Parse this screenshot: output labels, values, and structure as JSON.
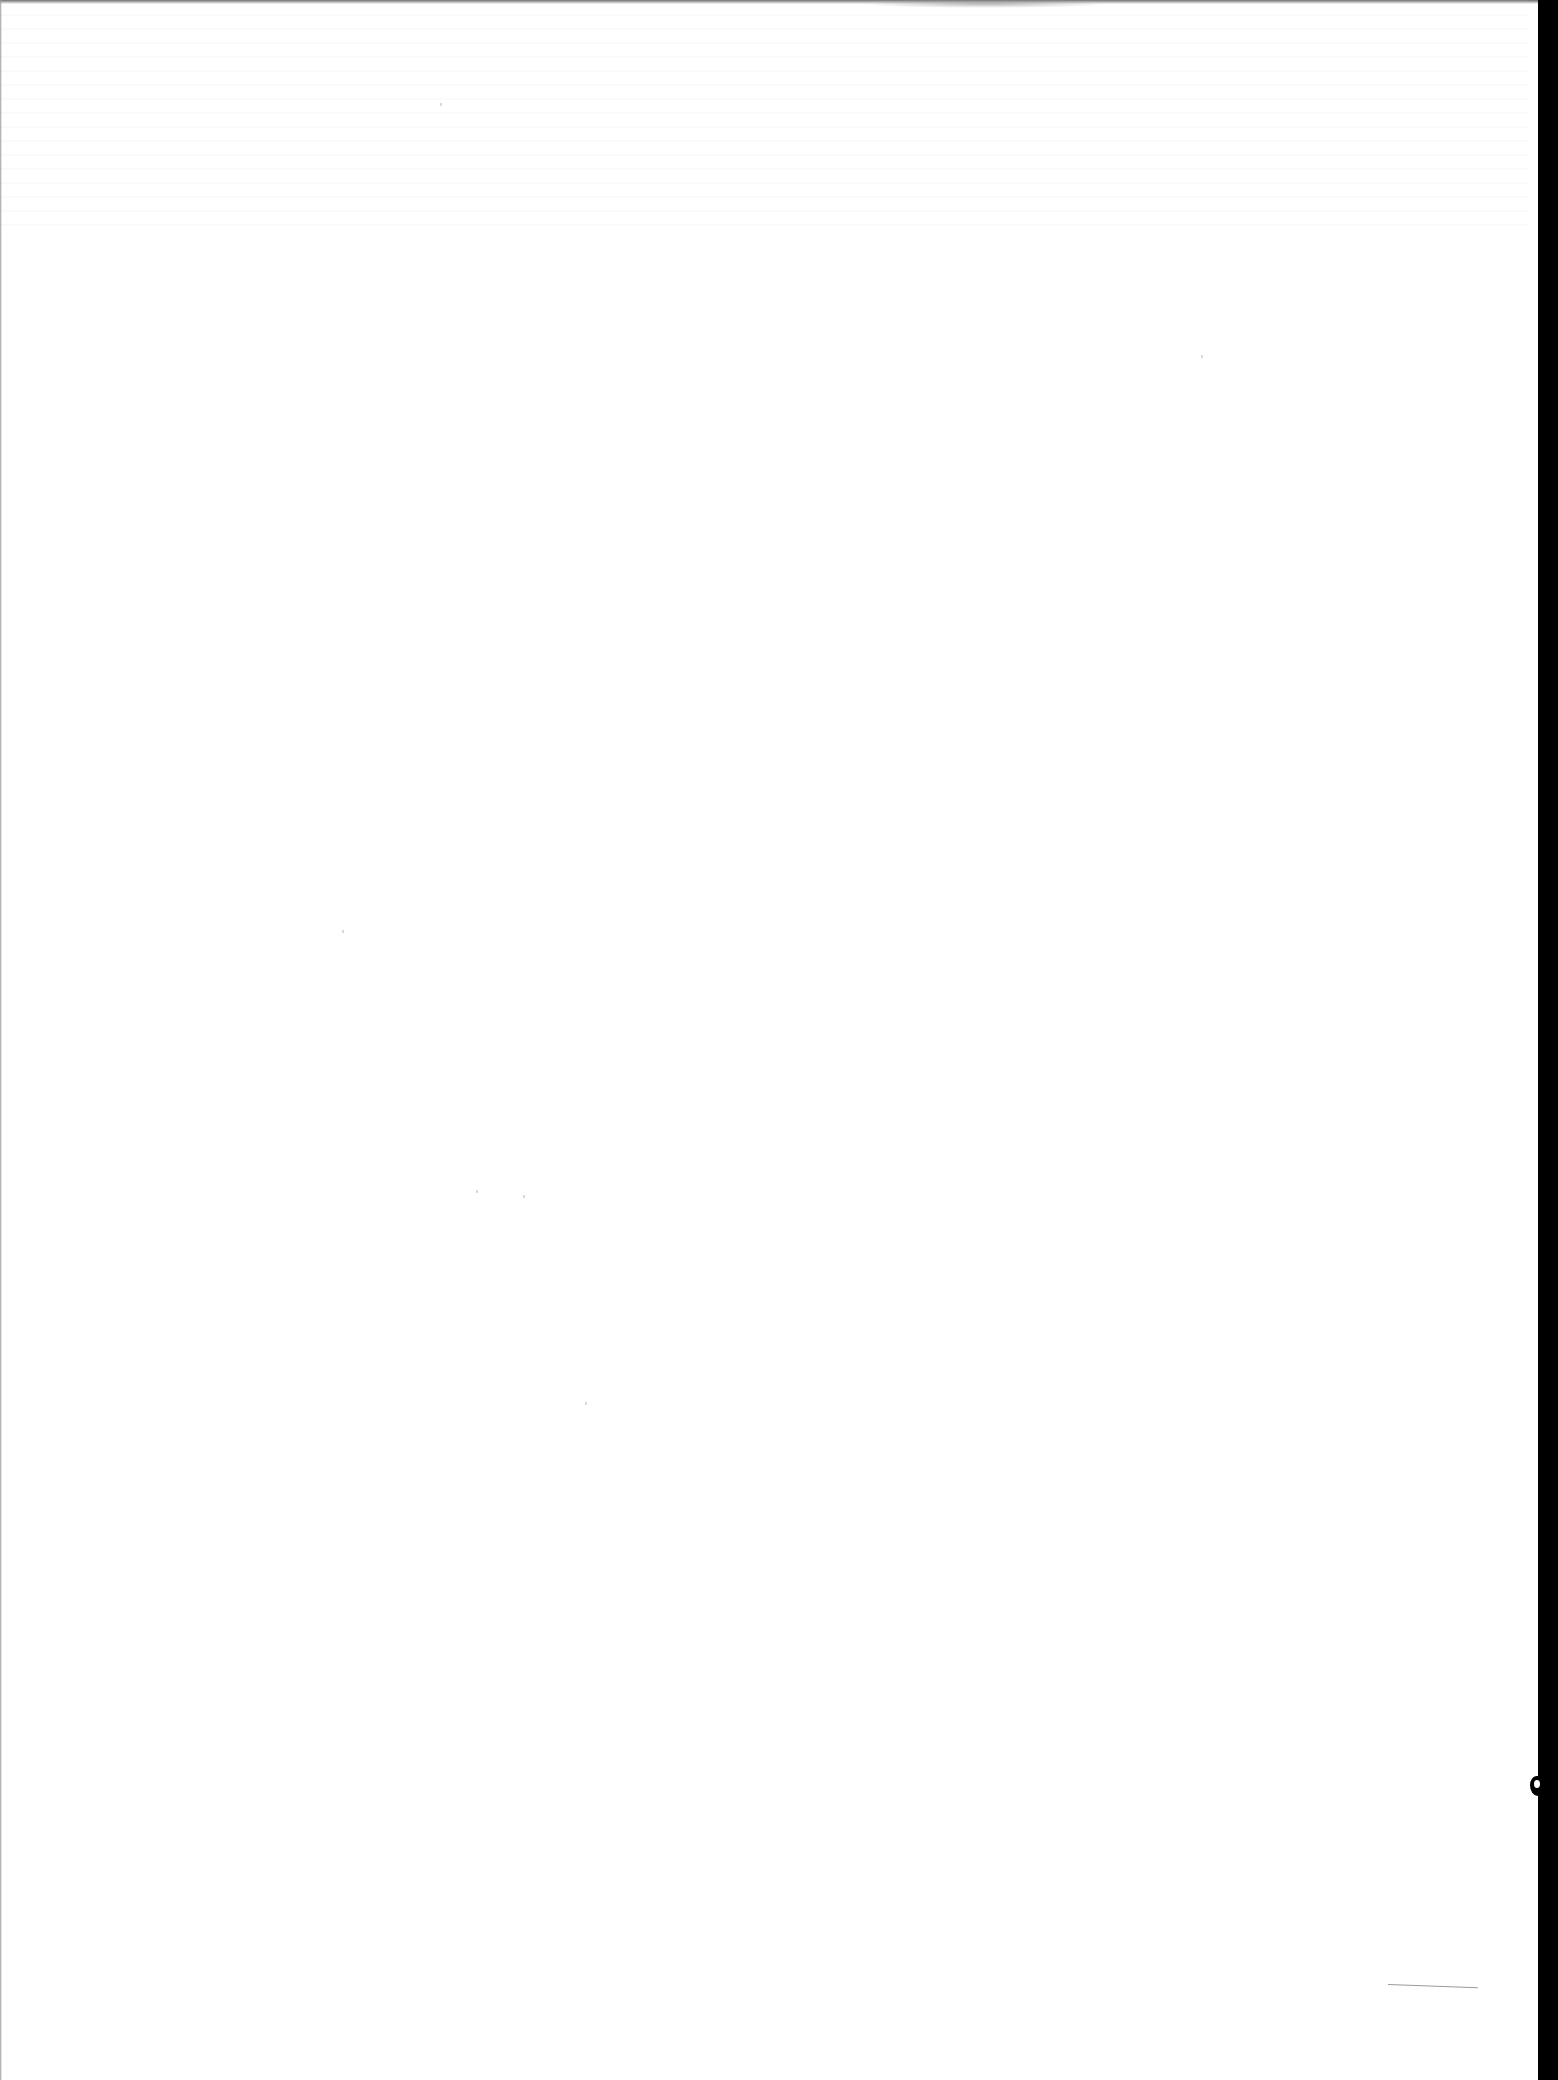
{
  "document": {
    "type": "blank-scanned-page",
    "text_content": ""
  },
  "colors": {
    "paper": "#ffffff",
    "scanner_border": "#000000",
    "pencil_mark": "#9a9a9a"
  }
}
